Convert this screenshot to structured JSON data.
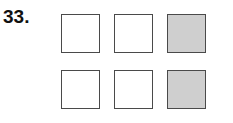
{
  "question": {
    "number": "33."
  },
  "grid": {
    "rows": 2,
    "cols": 3,
    "cells": [
      [
        {
          "shaded": false
        },
        {
          "shaded": false
        },
        {
          "shaded": true
        }
      ],
      [
        {
          "shaded": false
        },
        {
          "shaded": false
        },
        {
          "shaded": true
        }
      ]
    ],
    "shade_color": "#cfcfcf",
    "border_color": "#4a4a4a"
  }
}
